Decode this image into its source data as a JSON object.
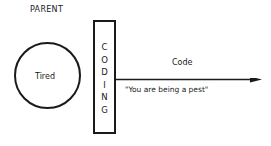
{
  "diagram": {
    "sender_label": "PARENT",
    "sender_state": "Tired",
    "process_box": {
      "label": "CODING",
      "letters": [
        "C",
        "O",
        "D",
        "I",
        "N",
        "G"
      ]
    },
    "arrow": {
      "label": "Code",
      "message": "\"You are being a pest\""
    },
    "colors": {
      "line": "#1a1a1a",
      "background": "#ffffff"
    }
  }
}
